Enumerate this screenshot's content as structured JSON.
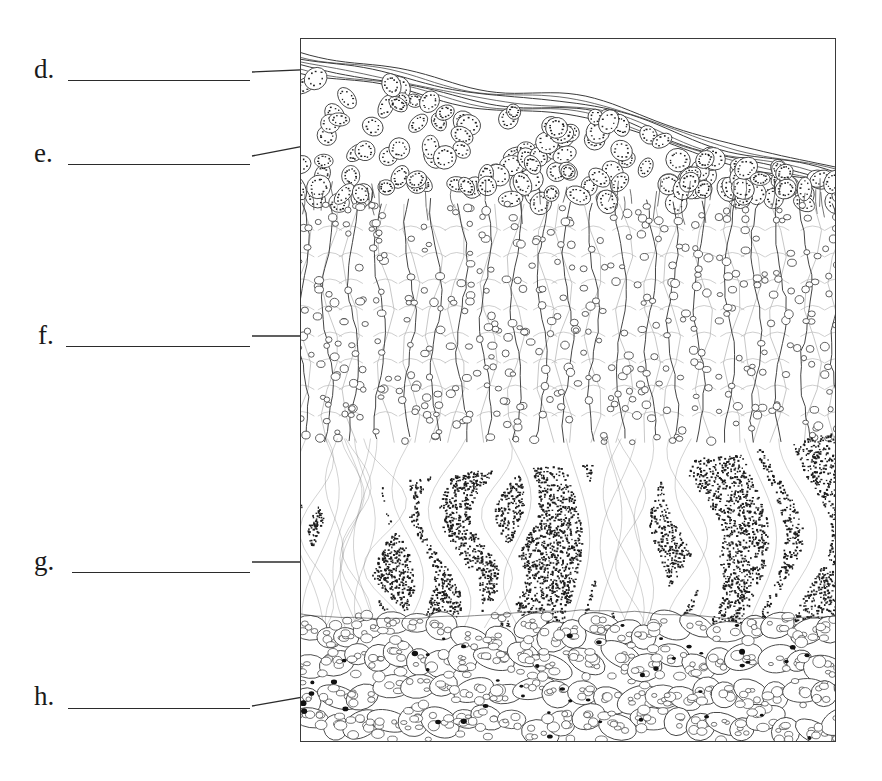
{
  "figure": {
    "frame": {
      "x": 300,
      "y": 38,
      "width": 536,
      "height": 704,
      "border_color": "#3a3a3a",
      "background_color": "#ffffff"
    },
    "ink_color": "#3a3a3a",
    "light_ink_color": "#b9b9b9",
    "stipple_color": "#1d1d1d"
  },
  "labels": [
    {
      "id": "d",
      "letter": "d.",
      "blank_text": "",
      "letter_x": 34,
      "letter_y": 56,
      "blank_x": 68,
      "blank_y": 79,
      "blank_width": 182,
      "leader": {
        "x1": 252,
        "y1": 72,
        "x2": 392,
        "y2": 66
      },
      "points_to": "cuticle-layer"
    },
    {
      "id": "e",
      "letter": "e.",
      "blank_text": "",
      "letter_x": 34,
      "letter_y": 140,
      "blank_x": 68,
      "blank_y": 163,
      "blank_width": 182,
      "leader": {
        "x1": 252,
        "y1": 156,
        "x2": 398,
        "y2": 128
      },
      "points_to": "upper-epidermis-layer"
    },
    {
      "id": "f",
      "letter": "f.",
      "blank_text": "",
      "letter_x": 38,
      "letter_y": 322,
      "blank_x": 66,
      "blank_y": 345,
      "blank_width": 184,
      "leader": {
        "x1": 252,
        "y1": 336,
        "x2": 386,
        "y2": 336
      },
      "points_to": "palisade-mesophyll-layer"
    },
    {
      "id": "g",
      "letter": "g.",
      "blank_text": "",
      "letter_x": 34,
      "letter_y": 548,
      "blank_x": 72,
      "blank_y": 571,
      "blank_width": 178,
      "leader": {
        "x1": 252,
        "y1": 562,
        "x2": 352,
        "y2": 562
      },
      "points_to": "spongy-mesophyll-layer"
    },
    {
      "id": "h",
      "letter": "h.",
      "blank_text": "",
      "letter_x": 34,
      "letter_y": 683,
      "blank_x": 68,
      "blank_y": 707,
      "blank_width": 182,
      "leader": {
        "x1": 252,
        "y1": 706,
        "x2": 366,
        "y2": 686
      },
      "points_to": "lower-epidermis-layer"
    }
  ],
  "layers": [
    {
      "id": "cuticle-layer",
      "name": "cuticle",
      "render": "wavy-parallel-lines",
      "top_fraction": 0.005,
      "bottom_fraction": 0.075,
      "line_count": 7
    },
    {
      "id": "upper-epidermis-layer",
      "name": "upper epidermis",
      "render": "stippled-oval-cells",
      "top_fraction": 0.055,
      "bottom_fraction": 0.235,
      "cell_count": 150
    },
    {
      "id": "palisade-mesophyll-layer",
      "name": "palisade mesophyll",
      "render": "columnar-cells-with-chloroplast-rings",
      "top_fraction": 0.235,
      "bottom_fraction": 0.575,
      "column_count": 20
    },
    {
      "id": "spongy-mesophyll-layer",
      "name": "spongy mesophyll",
      "render": "dense-stipple-with-air-spaces",
      "top_fraction": 0.555,
      "bottom_fraction": 0.84,
      "dot_count": 4200
    },
    {
      "id": "lower-epidermis-layer",
      "name": "lower epidermis",
      "render": "rounded-cells-with-nuclei",
      "top_fraction": 0.82,
      "bottom_fraction": 1.0,
      "cell_count": 190
    }
  ]
}
